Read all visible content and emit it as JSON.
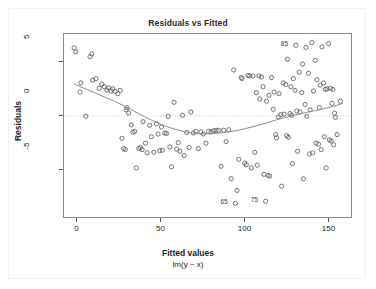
{
  "chart_data": {
    "type": "scatter",
    "title": "Residuals vs Fitted",
    "xlabel": "Fitted values",
    "sublabel": "lm(y ~ x)",
    "ylabel": "Residuals",
    "xlim": [
      -8,
      164
    ],
    "ylim": [
      -9.6,
      7.6
    ],
    "xticks": [
      0,
      50,
      100,
      150
    ],
    "yticks": [
      5,
      0,
      -5
    ],
    "grid": false,
    "legend": null,
    "marker": "open-circle",
    "marker_color": "#555555",
    "zero_line": {
      "y": 0,
      "style": "dotted",
      "color": "#d9d9d9"
    },
    "smoother": {
      "name": "loess",
      "color": "#8c8c8c",
      "points": [
        [
          -2.0,
          2.95
        ],
        [
          4.0,
          2.55
        ],
        [
          10.0,
          2.15
        ],
        [
          16.0,
          1.75
        ],
        [
          22.0,
          1.35
        ],
        [
          28.0,
          0.9
        ],
        [
          34.0,
          0.4
        ],
        [
          40.0,
          -0.1
        ],
        [
          46.0,
          -0.55
        ],
        [
          52.0,
          -0.95
        ],
        [
          58.0,
          -1.25
        ],
        [
          64.0,
          -1.5
        ],
        [
          70.0,
          -1.65
        ],
        [
          76.0,
          -1.7
        ],
        [
          82.0,
          -1.65
        ],
        [
          88.0,
          -1.55
        ],
        [
          94.0,
          -1.4
        ],
        [
          100.0,
          -1.2
        ],
        [
          106.0,
          -0.95
        ],
        [
          112.0,
          -0.7
        ],
        [
          118.0,
          -0.4
        ],
        [
          124.0,
          -0.15
        ],
        [
          130.0,
          0.1
        ],
        [
          136.0,
          0.3
        ],
        [
          142.0,
          0.5
        ],
        [
          148.0,
          0.7
        ],
        [
          154.0,
          0.95
        ],
        [
          158.0,
          1.15
        ]
      ]
    },
    "annotations": [
      {
        "label": "85",
        "x": 130.0,
        "y": 6.55,
        "dx": -9,
        "dy": -1
      },
      {
        "label": "65",
        "x": 94.0,
        "y": -8.15,
        "dx": -9,
        "dy": -1
      },
      {
        "label": "75",
        "x": 112.0,
        "y": -7.95,
        "dx": -9,
        "dy": -1
      }
    ],
    "series": [
      {
        "name": "residuals",
        "points": [
          [
            -2.0,
            6.3
          ],
          [
            -1.0,
            5.95
          ],
          [
            1.5,
            2.2
          ],
          [
            2.0,
            3.05
          ],
          [
            5.0,
            -0.05
          ],
          [
            7.5,
            5.5
          ],
          [
            8.5,
            5.75
          ],
          [
            9.0,
            3.3
          ],
          [
            11.0,
            3.45
          ],
          [
            13.0,
            2.55
          ],
          [
            14.5,
            2.95
          ],
          [
            16.0,
            2.7
          ],
          [
            17.5,
            2.4
          ],
          [
            18.5,
            2.6
          ],
          [
            20.0,
            2.3
          ],
          [
            21.0,
            2.5
          ],
          [
            22.5,
            2.25
          ],
          [
            24.0,
            2.05
          ],
          [
            25.5,
            2.35
          ],
          [
            26.5,
            -2.1
          ],
          [
            27.5,
            -3.05
          ],
          [
            28.5,
            -3.15
          ],
          [
            29.0,
            0.55
          ],
          [
            29.5,
            0.75
          ],
          [
            30.5,
            0.25
          ],
          [
            32.0,
            -0.85
          ],
          [
            33.0,
            -1.55
          ],
          [
            34.0,
            -1.45
          ],
          [
            35.0,
            -4.85
          ],
          [
            36.5,
            -3.05
          ],
          [
            37.5,
            -2.95
          ],
          [
            38.5,
            -3.15
          ],
          [
            39.0,
            -0.55
          ],
          [
            40.5,
            -2.55
          ],
          [
            41.5,
            -3.45
          ],
          [
            43.0,
            -0.9
          ],
          [
            44.0,
            -1.95
          ],
          [
            45.5,
            -3.4
          ],
          [
            47.0,
            -0.75
          ],
          [
            48.0,
            -1.7
          ],
          [
            49.0,
            -3.25
          ],
          [
            50.0,
            -1.05
          ],
          [
            50.5,
            -3.2
          ],
          [
            52.0,
            -1.6
          ],
          [
            53.0,
            -1.65
          ],
          [
            54.0,
            -0.05
          ],
          [
            55.0,
            -2.9
          ],
          [
            56.0,
            -4.75
          ],
          [
            57.5,
            1.25
          ],
          [
            59.0,
            -3.1
          ],
          [
            60.0,
            -2.5
          ],
          [
            61.0,
            -3.3
          ],
          [
            62.5,
            0.05
          ],
          [
            63.5,
            -3.7
          ],
          [
            65.0,
            -1.55
          ],
          [
            66.5,
            -2.95
          ],
          [
            67.5,
            0.35
          ],
          [
            69.0,
            -1.6
          ],
          [
            70.5,
            -1.45
          ],
          [
            72.0,
            -3.05
          ],
          [
            73.5,
            -1.5
          ],
          [
            75.0,
            -1.7
          ],
          [
            76.5,
            -2.55
          ],
          [
            78.0,
            -1.45
          ],
          [
            79.5,
            -1.5
          ],
          [
            81.0,
            -1.4
          ],
          [
            82.5,
            -1.35
          ],
          [
            84.0,
            -1.35
          ],
          [
            85.5,
            -4.7
          ],
          [
            87.0,
            -1.35
          ],
          [
            88.5,
            -2.4
          ],
          [
            90.0,
            -1.3
          ],
          [
            91.5,
            -5.85
          ],
          [
            93.0,
            4.25
          ],
          [
            94.0,
            -8.15
          ],
          [
            95.0,
            -6.95
          ],
          [
            96.0,
            -4.05
          ],
          [
            97.5,
            3.55
          ],
          [
            98.0,
            3.45
          ],
          [
            99.5,
            -4.4
          ],
          [
            100.5,
            -4.55
          ],
          [
            101.5,
            3.75
          ],
          [
            102.5,
            3.7
          ],
          [
            103.5,
            -4.85
          ],
          [
            104.5,
            3.7
          ],
          [
            105.5,
            -3.4
          ],
          [
            106.5,
            2.15
          ],
          [
            107.0,
            -4.6
          ],
          [
            108.0,
            3.7
          ],
          [
            108.5,
            1.55
          ],
          [
            109.5,
            3.6
          ],
          [
            110.5,
            2.7
          ],
          [
            111.0,
            -5.45
          ],
          [
            112.0,
            -7.95
          ],
          [
            112.5,
            1.35
          ],
          [
            113.5,
            -5.55
          ],
          [
            114.0,
            1.9
          ],
          [
            114.5,
            -5.6
          ],
          [
            115.5,
            3.55
          ],
          [
            116.5,
            0.6
          ],
          [
            117.0,
            2.2
          ],
          [
            118.0,
            -1.75
          ],
          [
            118.5,
            -2.05
          ],
          [
            119.5,
            -0.1
          ],
          [
            120.0,
            2.05
          ],
          [
            121.0,
            0.1
          ],
          [
            121.5,
            -6.55
          ],
          [
            122.5,
            3.05
          ],
          [
            123.0,
            0.15
          ],
          [
            124.0,
            2.9
          ],
          [
            124.5,
            -1.85
          ],
          [
            125.0,
            5.25
          ],
          [
            125.5,
            -2.0
          ],
          [
            126.5,
            0.2
          ],
          [
            127.0,
            2.7
          ],
          [
            127.5,
            0.05
          ],
          [
            128.0,
            -4.45
          ],
          [
            128.5,
            3.45
          ],
          [
            129.5,
            2.35
          ],
          [
            130.0,
            6.55
          ],
          [
            130.5,
            0.45
          ],
          [
            131.0,
            -3.3
          ],
          [
            132.0,
            4.05
          ],
          [
            132.5,
            0.35
          ],
          [
            133.5,
            2.15
          ],
          [
            134.0,
            4.8
          ],
          [
            134.5,
            -5.85
          ],
          [
            135.5,
            1.05
          ],
          [
            136.0,
            6.35
          ],
          [
            136.5,
            -0.05
          ],
          [
            137.5,
            3.95
          ],
          [
            138.0,
            -3.55
          ],
          [
            138.5,
            0.55
          ],
          [
            139.5,
            6.8
          ],
          [
            140.0,
            -3.45
          ],
          [
            140.5,
            2.3
          ],
          [
            141.5,
            5.15
          ],
          [
            142.0,
            -2.55
          ],
          [
            142.5,
            3.35
          ],
          [
            143.5,
            -2.65
          ],
          [
            144.0,
            0.75
          ],
          [
            144.5,
            2.85
          ],
          [
            145.0,
            -3.15
          ],
          [
            145.5,
            6.4
          ],
          [
            146.5,
            3.05
          ],
          [
            147.0,
            -1.95
          ],
          [
            147.5,
            2.45
          ],
          [
            148.0,
            -4.85
          ],
          [
            148.5,
            2.5
          ],
          [
            149.5,
            6.7
          ],
          [
            150.0,
            -2.25
          ],
          [
            150.5,
            2.55
          ],
          [
            151.0,
            -2.35
          ],
          [
            151.5,
            1.15
          ],
          [
            152.0,
            2.45
          ],
          [
            152.5,
            -2.7
          ],
          [
            153.0,
            0.25
          ],
          [
            153.5,
            -0.15
          ],
          [
            154.5,
            -1.75
          ],
          [
            156.5,
            1.35
          ]
        ]
      }
    ]
  }
}
